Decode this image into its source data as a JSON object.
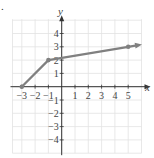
{
  "marker": ".",
  "chart_data": {
    "type": "line",
    "title": "",
    "xlabel": "x",
    "ylabel": "y",
    "xlim": [
      -4,
      6
    ],
    "ylim": [
      -5,
      5
    ],
    "grid": true,
    "x_ticks": [
      "-3",
      "-2",
      "-1",
      "1",
      "2",
      "3",
      "4",
      "5"
    ],
    "y_ticks": [
      "4",
      "3",
      "2",
      "1",
      "-1",
      "-2",
      "-3",
      "-4"
    ],
    "series": [
      {
        "name": "piecewise",
        "points": [
          [
            -3,
            0
          ],
          [
            -1,
            2
          ],
          [
            5,
            3
          ]
        ],
        "closed_dots": [
          [
            -3,
            0
          ],
          [
            -1,
            2
          ],
          [
            5,
            3
          ]
        ],
        "arrow_end": "right",
        "color": "#808080"
      }
    ]
  }
}
